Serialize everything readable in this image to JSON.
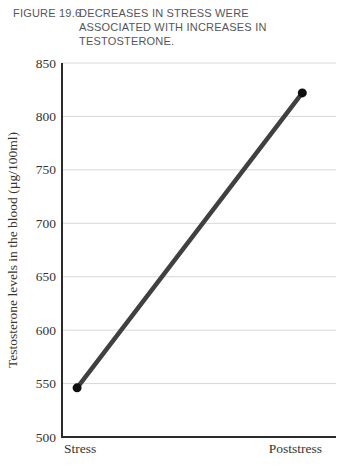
{
  "figure": {
    "label": "FIGURE 19.6",
    "caption": "DECREASES IN STRESS WERE ASSOCIATED WITH INCREASES IN TESTOSTERONE.",
    "caption_lines": [
      "DECREASES IN STRESS WERE",
      "ASSOCIATED WITH INCREASES IN",
      "TESTOSTERONE."
    ]
  },
  "chart_data": {
    "type": "line",
    "categories": [
      "Stress",
      "Poststress"
    ],
    "values": [
      546,
      822
    ],
    "title": "",
    "xlabel": "",
    "ylabel": "Testosterone levels in the blood (µg/100ml)",
    "ylim": [
      500,
      850
    ],
    "ytick_step": 50,
    "yticks": [
      500,
      550,
      600,
      650,
      700,
      750,
      800,
      850
    ],
    "grid": true,
    "legend": "none",
    "colors": {
      "line": "#404040",
      "point": "#0f0f0f",
      "axis": "#2b2b2b",
      "gridline": "#d9d7d3",
      "caption_text": "#55565a",
      "label_text": "#38342f"
    }
  }
}
